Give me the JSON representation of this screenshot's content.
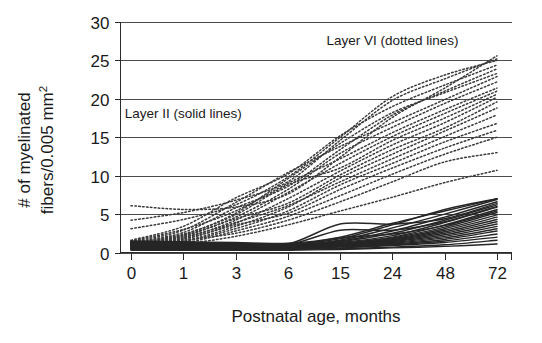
{
  "chart_data": {
    "type": "line",
    "title": "",
    "xlabel": "Postnatal age, months",
    "ylabel": "# of myelinated fibers/0.005 mm²",
    "ylabel_line1": "# of myelinated",
    "ylabel_line2": "fibers/0.005 mm",
    "ylabel_superscript": "2",
    "categories": [
      "0",
      "1",
      "3",
      "6",
      "15",
      "24",
      "48",
      "72"
    ],
    "x_tick_labels": [
      "0",
      "1",
      "3",
      "6",
      "15",
      "24",
      "48",
      "72"
    ],
    "y_tick_labels": [
      "0",
      "5",
      "10",
      "15",
      "20",
      "25",
      "30"
    ],
    "y_ticks": [
      0,
      5,
      10,
      15,
      20,
      25,
      30
    ],
    "ylim": [
      0,
      30
    ],
    "grid": "horizontal",
    "legend_position": "inline-annotation",
    "annotations": [
      {
        "text": "Layer VI (dotted lines)",
        "x_category": "24",
        "y_value": 27.0
      },
      {
        "text": "Layer II (solid lines)",
        "x_category": "1",
        "y_value": 17.5
      }
    ],
    "groups": [
      {
        "name": "Layer VI",
        "style": "dotted",
        "color": "#3b3b3b",
        "series": [
          {
            "name": "VI-01",
            "values": [
              6.1,
              5.6,
              5.9,
              7.6,
              12.4,
              17.6,
              21.4,
              25.6
            ]
          },
          {
            "name": "VI-02",
            "values": [
              4.2,
              5.2,
              6.8,
              9.2,
              14.6,
              19.8,
              22.6,
              25.2
            ]
          },
          {
            "name": "VI-03",
            "values": [
              3.1,
              4.3,
              6.2,
              9.8,
              15.0,
              20.3,
              23.1,
              25.0
            ]
          },
          {
            "name": "VI-04",
            "values": [
              1.6,
              3.4,
              7.1,
              10.2,
              15.2,
              19.0,
              21.8,
              24.4
            ]
          },
          {
            "name": "VI-05",
            "values": [
              1.3,
              2.6,
              5.8,
              8.6,
              13.4,
              17.9,
              21.0,
              23.9
            ]
          },
          {
            "name": "VI-06",
            "values": [
              1.2,
              2.3,
              5.1,
              9.6,
              14.2,
              18.2,
              20.8,
              23.3
            ]
          },
          {
            "name": "VI-07",
            "values": [
              1.4,
              2.9,
              6.5,
              10.4,
              13.8,
              16.9,
              19.9,
              22.9
            ]
          },
          {
            "name": "VI-08",
            "values": [
              1.1,
              2.1,
              4.6,
              8.2,
              12.9,
              16.3,
              19.4,
              22.2
            ]
          },
          {
            "name": "VI-09",
            "values": [
              1.5,
              3.0,
              5.4,
              9.0,
              12.2,
              15.6,
              18.6,
              21.4
            ]
          },
          {
            "name": "VI-10",
            "values": [
              1.0,
              1.9,
              4.2,
              7.8,
              11.6,
              15.1,
              18.1,
              21.0
            ]
          },
          {
            "name": "VI-11",
            "values": [
              1.3,
              2.4,
              4.9,
              8.8,
              11.0,
              14.6,
              17.5,
              20.6
            ]
          },
          {
            "name": "VI-12",
            "values": [
              0.9,
              1.7,
              3.8,
              7.0,
              10.6,
              14.0,
              16.9,
              20.2
            ]
          },
          {
            "name": "VI-13",
            "values": [
              1.2,
              2.2,
              4.4,
              6.4,
              10.1,
              13.4,
              16.2,
              19.6
            ]
          },
          {
            "name": "VI-14",
            "values": [
              0.8,
              1.5,
              3.4,
              5.9,
              9.7,
              12.8,
              15.8,
              18.8
            ]
          },
          {
            "name": "VI-15",
            "values": [
              1.1,
              2.0,
              3.9,
              6.1,
              9.2,
              12.2,
              15.1,
              17.9
            ]
          },
          {
            "name": "VI-16",
            "values": [
              0.7,
              1.4,
              3.1,
              5.4,
              8.8,
              11.6,
              14.4,
              16.8
            ]
          },
          {
            "name": "VI-17",
            "values": [
              1.0,
              1.8,
              3.6,
              5.1,
              8.2,
              11.0,
              13.6,
              15.9
            ]
          },
          {
            "name": "VI-18",
            "values": [
              0.6,
              1.2,
              2.8,
              4.7,
              7.4,
              10.2,
              12.8,
              15.0
            ]
          },
          {
            "name": "VI-19",
            "values": [
              0.9,
              1.6,
              2.5,
              4.2,
              6.6,
              9.2,
              11.8,
              13.0
            ]
          },
          {
            "name": "VI-20",
            "values": [
              0.6,
              1.1,
              2.1,
              3.6,
              5.4,
              7.2,
              9.1,
              10.7
            ]
          }
        ]
      },
      {
        "name": "Layer II",
        "style": "solid",
        "color": "#262626",
        "series": [
          {
            "name": "II-01",
            "values": [
              1.5,
              1.4,
              1.3,
              1.2,
              2.0,
              3.8,
              5.4,
              7.0
            ]
          },
          {
            "name": "II-02",
            "values": [
              1.4,
              1.3,
              1.2,
              1.1,
              1.8,
              3.6,
              5.6,
              7.0
            ]
          },
          {
            "name": "II-03",
            "values": [
              1.3,
              1.2,
              1.1,
              1.0,
              1.6,
              3.2,
              5.0,
              6.9
            ]
          },
          {
            "name": "II-04",
            "values": [
              1.2,
              1.1,
              1.0,
              1.0,
              1.5,
              2.8,
              4.6,
              6.6
            ]
          },
          {
            "name": "II-05",
            "values": [
              1.1,
              1.0,
              1.0,
              0.9,
              1.4,
              2.5,
              4.2,
              6.2
            ]
          },
          {
            "name": "II-06",
            "values": [
              1.0,
              1.0,
              0.9,
              0.9,
              1.3,
              2.2,
              3.9,
              5.9
            ]
          },
          {
            "name": "II-07",
            "values": [
              1.0,
              0.9,
              0.9,
              0.8,
              1.2,
              2.0,
              3.6,
              5.6
            ]
          },
          {
            "name": "II-08",
            "values": [
              0.9,
              0.9,
              0.8,
              0.8,
              1.2,
              1.9,
              3.3,
              5.2
            ]
          },
          {
            "name": "II-09",
            "values": [
              0.9,
              0.8,
              0.8,
              0.8,
              1.1,
              1.8,
              3.1,
              4.9
            ]
          },
          {
            "name": "II-10",
            "values": [
              0.8,
              0.8,
              0.7,
              0.7,
              1.1,
              1.7,
              2.9,
              4.6
            ]
          },
          {
            "name": "II-11",
            "values": [
              0.8,
              0.7,
              0.7,
              0.7,
              1.0,
              1.6,
              2.7,
              4.3
            ]
          },
          {
            "name": "II-12",
            "values": [
              0.7,
              0.7,
              0.6,
              0.7,
              1.0,
              1.5,
              2.5,
              4.0
            ]
          },
          {
            "name": "II-13",
            "values": [
              0.7,
              0.6,
              0.6,
              0.6,
              0.9,
              1.4,
              2.3,
              3.7
            ]
          },
          {
            "name": "II-14",
            "values": [
              0.6,
              0.6,
              0.6,
              0.6,
              0.9,
              1.3,
              2.1,
              3.4
            ]
          },
          {
            "name": "II-15",
            "values": [
              0.6,
              0.5,
              0.5,
              0.6,
              0.8,
              1.2,
              1.9,
              3.1
            ]
          },
          {
            "name": "II-16",
            "values": [
              0.5,
              0.5,
              0.5,
              0.5,
              0.8,
              1.1,
              1.7,
              2.8
            ]
          },
          {
            "name": "II-17",
            "values": [
              0.5,
              0.4,
              0.4,
              0.5,
              0.7,
              1.0,
              1.5,
              2.4
            ]
          },
          {
            "name": "II-18",
            "values": [
              0.4,
              0.4,
              0.4,
              0.4,
              0.6,
              0.9,
              1.3,
              2.0
            ]
          },
          {
            "name": "II-19",
            "values": [
              0.4,
              0.3,
              0.3,
              0.4,
              0.5,
              0.7,
              1.0,
              1.6
            ]
          },
          {
            "name": "II-20",
            "values": [
              0.3,
              0.3,
              0.3,
              0.3,
              0.4,
              0.6,
              0.8,
              1.1
            ]
          },
          {
            "name": "II-21",
            "values": [
              1.4,
              1.3,
              1.2,
              1.1,
              3.7,
              3.7,
              4.4,
              6.4
            ]
          },
          {
            "name": "II-22",
            "values": [
              1.2,
              1.1,
              1.0,
              1.0,
              2.9,
              2.9,
              4.0,
              6.0
            ]
          },
          {
            "name": "II-23",
            "values": [
              1.0,
              1.0,
              0.9,
              0.9,
              1.9,
              2.4,
              3.5,
              5.4
            ]
          }
        ]
      }
    ]
  }
}
